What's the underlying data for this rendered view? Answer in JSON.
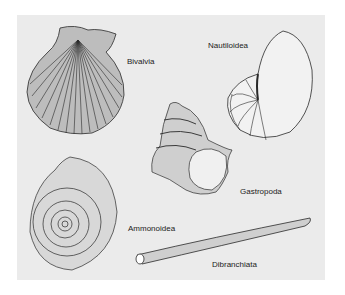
{
  "figure": {
    "background": "#ebebeb",
    "ink": "#2a2a2a",
    "labels": {
      "bivalvia": "Bivalvia",
      "nautiloidea": "Nautiloidea",
      "gastropoda": "Gastropoda",
      "ammonoidea": "Ammonoidea",
      "dibranchiata": "Dibranchiata"
    }
  }
}
